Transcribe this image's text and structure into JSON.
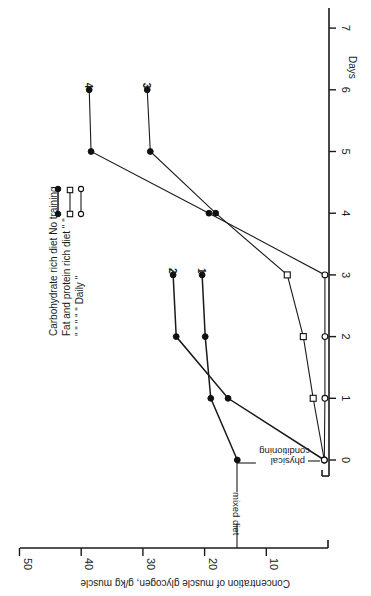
{
  "chart_data": {
    "type": "line",
    "orientation_note": "figure printed rotated 90 degrees clockwise; Days axis runs vertically (0 bottom, 7 top), concentration axis runs horizontally (0 right, 50 left)",
    "title": "",
    "xlabel": "Days",
    "ylabel": "Concentration of muscle glycogen, g/kg muscle",
    "x_ticks": [
      "0",
      "1",
      "2",
      "3",
      "4",
      "5",
      "6",
      "7"
    ],
    "y_ticks": [
      "10",
      "20",
      "30",
      "40",
      "50"
    ],
    "xlim": [
      0,
      7
    ],
    "ylim": [
      0,
      50
    ],
    "grid": false,
    "legend": {
      "position": "upper-left (rotated)",
      "entries": [
        {
          "text": "Carbohydrate rich diet No training",
          "marker": "filled-circle"
        },
        {
          "text": "Fat and protein rich diet \"    \"",
          "marker": "open-square"
        },
        {
          "text": "\"    \"    \"    \"    \"    Daily    \"",
          "marker": "open-circle"
        }
      ]
    },
    "annotations": [
      "mixed diet",
      "physical conditioning"
    ],
    "series": [
      {
        "name": "1",
        "description": "mixed diet then carbohydrate rich diet",
        "marker": "filled-circle",
        "x": [
          0,
          1,
          2,
          3
        ],
        "values": [
          14.7,
          19.0,
          19.9,
          20.4
        ]
      },
      {
        "name": "2",
        "description": "physical conditioning then carbohydrate rich diet",
        "marker": "filled-circle",
        "x": [
          0,
          1,
          2,
          3
        ],
        "values": [
          0.6,
          16.2,
          24.6,
          25.1
        ]
      },
      {
        "name": "3",
        "description": "fat and protein rich diet (no training) then carbohydrate rich diet",
        "marker_seq": [
          "open-circle",
          "open-square",
          "open-square",
          "open-square",
          "filled-circle",
          "filled-circle",
          "filled-circle"
        ],
        "x": [
          0,
          1,
          2,
          3,
          4,
          5,
          6
        ],
        "values": [
          0.6,
          2.4,
          4.0,
          6.6,
          18.2,
          28.8,
          29.3
        ]
      },
      {
        "name": "4",
        "description": "fat and protein rich diet with daily training then carbohydrate rich diet",
        "marker_seq": [
          "open-circle",
          "open-circle",
          "open-circle",
          "open-circle",
          "filled-circle",
          "filled-circle",
          "filled-circle"
        ],
        "x": [
          0,
          1,
          2,
          3,
          4,
          5,
          6
        ],
        "values": [
          0.6,
          0.5,
          0.5,
          0.5,
          19.3,
          38.4,
          38.7
        ]
      }
    ]
  },
  "labels": {
    "days": "Days",
    "y_axis_title": "Concentration of muscle glycogen, g/kg muscle",
    "mixed_diet": "mixed diet",
    "physical_line1": "physical",
    "physical_line2": "conditioning",
    "legend_line1": "Carbohydrate rich diet No training",
    "legend_line2": "Fat and protein rich diet  \"    \"",
    "legend_line3": "\"    \"    \"    \"    \"    Daily    \""
  }
}
